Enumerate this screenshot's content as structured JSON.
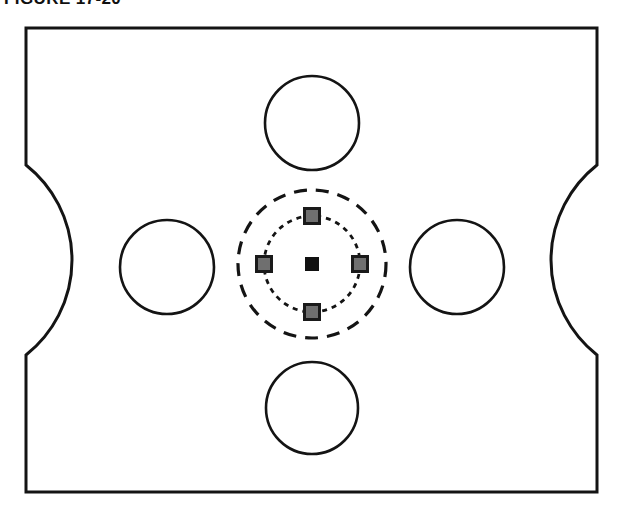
{
  "figure": {
    "caption": "FIGURE 17-20",
    "caption_clipped": true,
    "background_color": "#ffffff",
    "line_color": "#141414"
  },
  "plate": {
    "name": "rectangular-plate-outline",
    "x": 26,
    "y": 28,
    "width": 571,
    "height": 464,
    "stroke_width": 3,
    "stroke_color": "#141414",
    "fill_color": "#ffffff",
    "notches": [
      {
        "name": "left-concave-notch",
        "side": "left",
        "edge_x": 26,
        "start_y": 165,
        "end_y": 355,
        "depth_x": 72
      },
      {
        "name": "right-concave-notch",
        "side": "right",
        "edge_x": 597,
        "start_y": 165,
        "end_y": 355,
        "depth_x": 551
      }
    ]
  },
  "holes": [
    {
      "name": "top-hole",
      "cx": 312,
      "cy": 123,
      "r": 47,
      "stroke_width": 2.6
    },
    {
      "name": "right-hole",
      "cx": 457,
      "cy": 267,
      "r": 47,
      "stroke_width": 2.6
    },
    {
      "name": "bottom-hole",
      "cx": 312,
      "cy": 408,
      "r": 46,
      "stroke_width": 2.6
    },
    {
      "name": "left-hole",
      "cx": 167,
      "cy": 267,
      "r": 47,
      "stroke_width": 2.6
    }
  ],
  "bolt_pattern": {
    "center_x": 312,
    "center_y": 264,
    "outer_circle": {
      "name": "outer-dashed-bolt-circle",
      "r": 74,
      "stroke_width": 3.2,
      "dash": "13 9",
      "style": "long-dashed"
    },
    "inner_circle": {
      "name": "inner-dotted-bolt-circle",
      "r": 48,
      "stroke_width": 2.8,
      "dash": "5 5",
      "style": "short-dashed"
    },
    "center_marker": {
      "name": "center-marker-square",
      "size": 13,
      "fill": "#111111",
      "stroke": "#111111"
    },
    "satellite_markers": [
      {
        "name": "satellite-square-north",
        "cx": 312,
        "cy": 216,
        "size": 15,
        "fill": "#6f6f6f",
        "stroke": "#1a1a1a",
        "stroke_width": 3
      },
      {
        "name": "satellite-square-east",
        "cx": 360,
        "cy": 264,
        "size": 15,
        "fill": "#6f6f6f",
        "stroke": "#1a1a1a",
        "stroke_width": 3
      },
      {
        "name": "satellite-square-south",
        "cx": 312,
        "cy": 312,
        "size": 15,
        "fill": "#6f6f6f",
        "stroke": "#1a1a1a",
        "stroke_width": 3
      },
      {
        "name": "satellite-square-west",
        "cx": 264,
        "cy": 264,
        "size": 15,
        "fill": "#6f6f6f",
        "stroke": "#1a1a1a",
        "stroke_width": 3
      }
    ]
  }
}
